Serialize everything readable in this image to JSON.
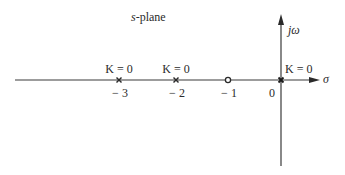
{
  "diagram": {
    "title": "s-plane",
    "title_italic_part": "s",
    "title_rest": "-plane",
    "axes": {
      "real_axis_label": "σ",
      "imag_axis_label": "jω"
    },
    "colors": {
      "line": "#3a3a3a",
      "text": "#2b2b2b",
      "background": "#ffffff"
    },
    "points": [
      {
        "type": "pole",
        "symbol": "×",
        "value": -3,
        "tick_label": "− 3",
        "gain_label": "K = 0"
      },
      {
        "type": "pole",
        "symbol": "×",
        "value": -2,
        "tick_label": "− 2",
        "gain_label": "K = 0"
      },
      {
        "type": "zero",
        "symbol": "○",
        "value": -1,
        "tick_label": "− 1",
        "gain_label": ""
      },
      {
        "type": "pole",
        "symbol": "×",
        "value": 0,
        "tick_label": "0",
        "gain_label": "K = 0"
      }
    ]
  }
}
